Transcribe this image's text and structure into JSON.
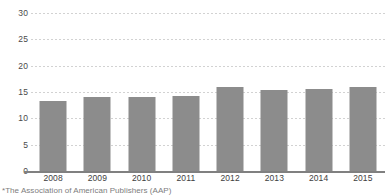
{
  "chart_data": {
    "type": "bar",
    "title": "",
    "subtitle": "",
    "xlabel": "",
    "ylabel": "",
    "categories": [
      "2008",
      "2009",
      "2010",
      "2011",
      "2012",
      "2013",
      "2014",
      "2015"
    ],
    "values": [
      13.3,
      14.0,
      14.0,
      14.2,
      15.9,
      15.4,
      15.5,
      16.0
    ],
    "series": [
      {
        "name": "",
        "values": [
          13.3,
          14.0,
          14.0,
          14.2,
          15.9,
          15.4,
          15.5,
          16.0
        ]
      }
    ],
    "ylim": [
      0,
      30
    ],
    "yticks": [
      0,
      5,
      10,
      15,
      20,
      25,
      30
    ],
    "ytick_labels": [
      "0",
      "5",
      "10",
      "15",
      "20",
      "25",
      "30"
    ],
    "xtick_labels": [
      "2008",
      "2009",
      "2010",
      "2011",
      "2012",
      "2013",
      "2014",
      "2015"
    ],
    "grid": true,
    "grid_axis": "y",
    "legend": false,
    "legend_position": "none",
    "bar_color": "#8c8c8c",
    "gridline_color": "#d2d2d2",
    "axis_color": "#808080",
    "tick_label_color": "#4a4a4a",
    "background_color": "#ffffff",
    "annotations": []
  },
  "footnote": {
    "text": "*The Association of American Publishers (AAP)"
  }
}
